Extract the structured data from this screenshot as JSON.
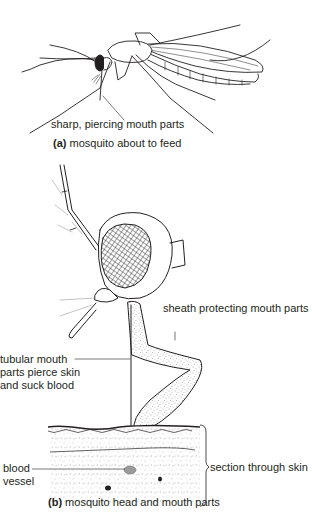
{
  "figure": {
    "panel_a": {
      "caption_letter": "(a)",
      "caption_text": " mosquito about to feed",
      "labels": {
        "mouth_parts": "sharp, piercing mouth parts"
      }
    },
    "panel_b": {
      "caption_letter": "(b)",
      "caption_text": " mosquito head and mouth parts",
      "labels": {
        "sheath": "sheath protecting mouth parts",
        "tubular_line1": "tubular mouth",
        "tubular_line2": "parts pierce skin",
        "tubular_line3": "and suck blood",
        "blood_line1": "blood",
        "blood_line2": "vessel",
        "skin": "section through skin"
      }
    },
    "colors": {
      "ink": "#231f20",
      "stipple": "#8a8a8a",
      "background": "#ffffff"
    }
  }
}
